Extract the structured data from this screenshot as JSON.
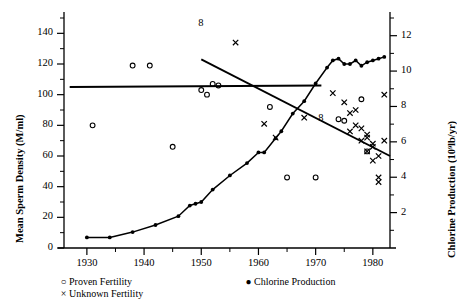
{
  "chart_data": {
    "type": "scatter",
    "title": "",
    "xlabel": "",
    "xlim": [
      1926,
      1983
    ],
    "xticks": [
      1930,
      1940,
      1950,
      1960,
      1970,
      1980
    ],
    "xtick_labels": [
      "1930",
      "1940",
      "1950",
      "1960",
      "1970",
      "1980"
    ],
    "xminor_ticks": [
      1935,
      1945,
      1955,
      1965,
      1975
    ],
    "grid": false,
    "legend_position": "below-left",
    "axes": [
      {
        "id": "left",
        "label": "Mean Sperm Density (M/ml)",
        "ylim": [
          0,
          150
        ],
        "yticks": [
          0,
          20,
          40,
          60,
          80,
          100,
          120,
          140
        ],
        "ytick_labels": [
          "0",
          "20",
          "40",
          "60",
          "80",
          "100",
          "120",
          "140"
        ],
        "yminor_ticks": [
          10,
          30,
          50,
          70,
          90,
          110,
          130,
          150
        ]
      },
      {
        "id": "right",
        "label": "Chlorine Production (10⁹lb/yr)",
        "ylim": [
          0,
          13
        ],
        "yticks": [
          2,
          4,
          6,
          8,
          10,
          12
        ],
        "ytick_labels": [
          "2",
          "4",
          "6",
          "8",
          "10",
          "12"
        ],
        "yminor_ticks": [
          1,
          3,
          5,
          7,
          9,
          11,
          13
        ]
      }
    ],
    "series": [
      {
        "name": "Proven Fertility",
        "marker": "open-circle",
        "axis": "left",
        "points": [
          [
            1931,
            80
          ],
          [
            1938,
            119
          ],
          [
            1941,
            119
          ],
          [
            1945,
            66
          ],
          [
            1950,
            103
          ],
          [
            1951,
            100
          ],
          [
            1952,
            107
          ],
          [
            1953,
            106
          ],
          [
            1962,
            92
          ],
          [
            1965,
            46
          ],
          [
            1970,
            46
          ],
          [
            1974,
            84
          ],
          [
            1975,
            83
          ],
          [
            1978,
            97
          ],
          [
            1979,
            63
          ]
        ]
      },
      {
        "name": "Unknown Fertility",
        "marker": "cross",
        "axis": "left",
        "points": [
          [
            1956,
            134
          ],
          [
            1961,
            81
          ],
          [
            1963,
            72
          ],
          [
            1968,
            85
          ],
          [
            1973,
            101
          ],
          [
            1975,
            95
          ],
          [
            1976,
            88
          ],
          [
            1976,
            76
          ],
          [
            1977,
            90
          ],
          [
            1977,
            80
          ],
          [
            1978,
            78
          ],
          [
            1978,
            70
          ],
          [
            1979,
            74
          ],
          [
            1979,
            72
          ],
          [
            1979,
            63
          ],
          [
            1980,
            68
          ],
          [
            1980,
            66
          ],
          [
            1980,
            57
          ],
          [
            1981,
            60
          ],
          [
            1981,
            43
          ],
          [
            1981,
            46
          ],
          [
            1982,
            70
          ],
          [
            1982,
            100
          ]
        ]
      },
      {
        "name": "Chlorine Production",
        "marker": "filled-circle",
        "line": true,
        "axis": "right",
        "points": [
          [
            1930,
            0.6
          ],
          [
            1934,
            0.6
          ],
          [
            1938,
            0.9
          ],
          [
            1942,
            1.3
          ],
          [
            1946,
            1.8
          ],
          [
            1948,
            2.4
          ],
          [
            1949,
            2.5
          ],
          [
            1950,
            2.6
          ],
          [
            1952,
            3.3
          ],
          [
            1955,
            4.1
          ],
          [
            1958,
            4.8
          ],
          [
            1960,
            5.4
          ],
          [
            1961,
            5.4
          ],
          [
            1963,
            6.2
          ],
          [
            1964,
            6.6
          ],
          [
            1966,
            7.6
          ],
          [
            1968,
            8.3
          ],
          [
            1970,
            9.3
          ],
          [
            1972,
            10.2
          ],
          [
            1973,
            10.6
          ],
          [
            1974,
            10.7
          ],
          [
            1975,
            10.4
          ],
          [
            1976,
            10.4
          ],
          [
            1977,
            10.6
          ],
          [
            1978,
            10.3
          ],
          [
            1979,
            10.5
          ],
          [
            1980,
            10.6
          ],
          [
            1981,
            10.7
          ],
          [
            1982,
            10.8
          ]
        ]
      }
    ],
    "trend_lines": [
      {
        "name": "flat-regression-line",
        "axis": "left",
        "x": [
          1927,
          1971
        ],
        "y": [
          105,
          106
        ]
      },
      {
        "name": "declining-regression-line",
        "axis": "left",
        "x": [
          1950,
          1983
        ],
        "y": [
          123,
          60
        ]
      }
    ],
    "annotations": [
      {
        "text": "8",
        "x": 1950,
        "y": 146,
        "axis": "left"
      },
      {
        "text": "8",
        "x": 1971,
        "y": 84,
        "axis": "left"
      }
    ],
    "legend": [
      {
        "symbol": "○",
        "label": "Proven Fertility"
      },
      {
        "symbol": "×",
        "label": "Unknown Fertility"
      },
      {
        "symbol": "●",
        "label": "Chlorine Production"
      }
    ],
    "colors": {
      "ink": "#000000",
      "background": "#ffffff"
    }
  }
}
